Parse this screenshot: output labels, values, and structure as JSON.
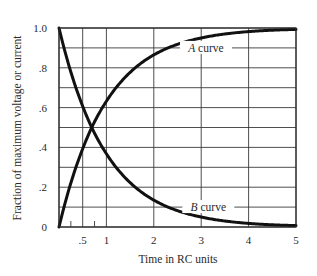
{
  "chart_data": {
    "type": "line",
    "title": "",
    "xlabel": "Time in RC units",
    "ylabel": "Fraction of maximum voltage or current",
    "xlim": [
      0,
      5
    ],
    "ylim": [
      0,
      1.0
    ],
    "grid": true,
    "x_gridlines": [
      0,
      0.5,
      1,
      2,
      3,
      4,
      5
    ],
    "y_gridlines": [
      0,
      0.1,
      0.2,
      0.3,
      0.4,
      0.5,
      0.6,
      0.7,
      0.8,
      0.9,
      1.0
    ],
    "x_minor_ticks": [
      0.25,
      0.75
    ],
    "x_tick_labels": [
      {
        "value": 0.5,
        "label": ".5"
      },
      {
        "value": 1,
        "label": "1"
      },
      {
        "value": 2,
        "label": "2"
      },
      {
        "value": 3,
        "label": "3"
      },
      {
        "value": 4,
        "label": "4"
      },
      {
        "value": 5,
        "label": "5"
      }
    ],
    "y_tick_labels": [
      {
        "value": 0,
        "label": "0"
      },
      {
        "value": 0.2,
        "label": ".2"
      },
      {
        "value": 0.4,
        "label": ".4"
      },
      {
        "value": 0.6,
        "label": ".6"
      },
      {
        "value": 0.8,
        "label": ".8"
      },
      {
        "value": 1.0,
        "label": "1.0"
      }
    ],
    "x": [
      0,
      0.25,
      0.5,
      0.69,
      1,
      1.5,
      2,
      2.5,
      3,
      3.5,
      4,
      4.5,
      5
    ],
    "series": [
      {
        "name": "A curve",
        "label": "A curve",
        "label_letter": "A",
        "label_rest": " curve",
        "label_y": 0.9,
        "label_x": 3.1,
        "values": [
          0,
          0.221,
          0.393,
          0.5,
          0.632,
          0.777,
          0.865,
          0.918,
          0.95,
          0.97,
          0.982,
          0.989,
          0.993
        ]
      },
      {
        "name": "B curve",
        "label": "B curve",
        "label_letter": "B",
        "label_rest": " curve",
        "label_y": 0.1,
        "label_x": 3.15,
        "values": [
          1.0,
          0.779,
          0.607,
          0.5,
          0.368,
          0.223,
          0.135,
          0.082,
          0.05,
          0.03,
          0.018,
          0.011,
          0.007
        ]
      }
    ],
    "annotations": [
      "A curve",
      "B curve"
    ]
  },
  "colors": {
    "curve": "#111111",
    "grid": "#3a3a3a",
    "background": "#ffffff"
  }
}
